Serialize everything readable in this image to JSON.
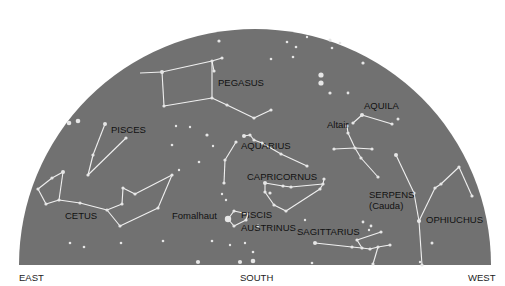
{
  "colors": {
    "sky": "#717171",
    "star": "#e6e6e6",
    "line": "#f0f0f0",
    "label": "#111111"
  },
  "dome": {
    "cx": 255,
    "baseY": 265,
    "rx": 236,
    "ry": 236,
    "left": 19,
    "right": 491
  },
  "directions": [
    {
      "label": "EAST",
      "x": 19,
      "y": 281
    },
    {
      "label": "SOUTH",
      "x": 240,
      "y": 281
    },
    {
      "label": "WEST",
      "x": 468,
      "y": 281
    }
  ],
  "constellations": [
    {
      "name": "PEGASUS",
      "x": 218,
      "y": 86,
      "stars": [
        [
          162,
          72
        ],
        [
          212,
          61
        ],
        [
          214,
          71
        ],
        [
          222,
          58
        ],
        [
          212,
          98
        ],
        [
          164,
          106
        ],
        [
          227,
          105
        ],
        [
          254,
          118
        ],
        [
          271,
          110
        ]
      ],
      "lines": [
        [
          0,
          1
        ],
        [
          1,
          4
        ],
        [
          4,
          5
        ],
        [
          5,
          0
        ],
        [
          1,
          2
        ],
        [
          1,
          3
        ],
        [
          4,
          6
        ],
        [
          6,
          7
        ],
        [
          7,
          8
        ],
        [
          0,
          -1
        ]
      ],
      "extra_lines": [
        [
          [
            162,
            72
          ],
          [
            140,
            73
          ]
        ]
      ]
    },
    {
      "name": "PISCES",
      "x": 111,
      "y": 133,
      "stars": [
        [
          105,
          124
        ],
        [
          126,
          138
        ],
        [
          93,
          155
        ],
        [
          88,
          175
        ]
      ],
      "lines": [
        [
          0,
          2
        ],
        [
          2,
          3
        ],
        [
          3,
          1
        ]
      ]
    },
    {
      "name": "CETUS",
      "x": 65,
      "y": 219,
      "stars": [
        [
          63,
          172
        ],
        [
          52,
          178
        ],
        [
          38,
          189
        ],
        [
          46,
          204
        ],
        [
          59,
          200
        ],
        [
          80,
          203
        ],
        [
          107,
          210
        ],
        [
          122,
          204
        ],
        [
          123,
          188
        ],
        [
          135,
          194
        ],
        [
          172,
          175
        ],
        [
          158,
          208
        ],
        [
          120,
          226
        ]
      ],
      "lines": [
        [
          0,
          1
        ],
        [
          1,
          2
        ],
        [
          2,
          3
        ],
        [
          3,
          4
        ],
        [
          4,
          0
        ],
        [
          4,
          5
        ],
        [
          5,
          6
        ],
        [
          6,
          7
        ],
        [
          7,
          8
        ],
        [
          8,
          9
        ],
        [
          9,
          10
        ],
        [
          10,
          11
        ],
        [
          11,
          12
        ],
        [
          12,
          6
        ]
      ]
    },
    {
      "name": "AQUARIUS",
      "x": 241,
      "y": 149,
      "stars": [
        [
          244,
          136
        ],
        [
          250,
          135
        ],
        [
          254,
          140
        ],
        [
          262,
          143
        ],
        [
          281,
          154
        ],
        [
          307,
          166
        ],
        [
          225,
          160
        ],
        [
          224,
          183
        ],
        [
          207,
          135
        ],
        [
          236,
          142
        ]
      ],
      "lines": [
        [
          0,
          1
        ],
        [
          1,
          2
        ],
        [
          2,
          3
        ],
        [
          3,
          4
        ],
        [
          4,
          5
        ],
        [
          9,
          6
        ],
        [
          6,
          7
        ]
      ]
    },
    {
      "name": "CAPRICORNUS",
      "x": 247,
      "y": 180,
      "stars": [
        [
          265,
          183
        ],
        [
          283,
          186
        ],
        [
          291,
          187
        ],
        [
          323,
          184
        ],
        [
          324,
          179
        ],
        [
          320,
          189
        ],
        [
          286,
          211
        ],
        [
          274,
          205
        ],
        [
          265,
          192
        ],
        [
          270,
          193
        ]
      ],
      "lines": [
        [
          0,
          1
        ],
        [
          1,
          2
        ],
        [
          2,
          3
        ],
        [
          3,
          4
        ],
        [
          3,
          5
        ],
        [
          5,
          6
        ],
        [
          6,
          7
        ],
        [
          7,
          8
        ],
        [
          8,
          0
        ]
      ]
    },
    {
      "name": "PISCIS\nAUSTRINUS",
      "x": 241,
      "y": 218,
      "line2_y": 231,
      "stars": [
        [
          228,
          219
        ],
        [
          234,
          211
        ],
        [
          234,
          226
        ],
        [
          246,
          220
        ],
        [
          248,
          214
        ],
        [
          258,
          226
        ]
      ],
      "lines": [
        [
          0,
          1
        ],
        [
          1,
          4
        ],
        [
          4,
          3
        ],
        [
          3,
          2
        ],
        [
          2,
          0
        ]
      ]
    },
    {
      "name": "Fomalhaut",
      "x": 172,
      "y": 219,
      "bright": [
        228,
        219
      ]
    },
    {
      "name": "SAGITTARIUS",
      "x": 297,
      "y": 235,
      "stars": [
        [
          315,
          243
        ],
        [
          352,
          247
        ],
        [
          362,
          248
        ],
        [
          370,
          249
        ],
        [
          378,
          247
        ],
        [
          390,
          245
        ],
        [
          381,
          232
        ],
        [
          357,
          240
        ],
        [
          373,
          264
        ]
      ],
      "lines": [
        [
          0,
          1
        ],
        [
          1,
          2
        ],
        [
          2,
          3
        ],
        [
          3,
          4
        ],
        [
          4,
          5
        ],
        [
          2,
          7
        ],
        [
          7,
          6
        ],
        [
          4,
          8
        ]
      ]
    },
    {
      "name": "AQUILA",
      "x": 364,
      "y": 109,
      "stars": [
        [
          362,
          115
        ],
        [
          353,
          123
        ],
        [
          347,
          126
        ],
        [
          392,
          124
        ],
        [
          348,
          133
        ],
        [
          355,
          148
        ],
        [
          334,
          149
        ],
        [
          372,
          149
        ],
        [
          361,
          158
        ],
        [
          378,
          177
        ]
      ],
      "lines": [
        [
          1,
          0
        ],
        [
          0,
          3
        ],
        [
          2,
          4
        ],
        [
          4,
          5
        ],
        [
          6,
          5
        ],
        [
          5,
          7
        ],
        [
          5,
          8
        ],
        [
          8,
          9
        ]
      ]
    },
    {
      "name": "Altair",
      "x": 327,
      "y": 128
    },
    {
      "name": "SERPENS\n(Cauda)",
      "x": 369,
      "y": 198,
      "line2_y": 209,
      "stars": [
        [
          396,
          155
        ],
        [
          414,
          193
        ],
        [
          419,
          221
        ],
        [
          422,
          265
        ]
      ],
      "lines": [
        [
          0,
          1
        ],
        [
          1,
          2
        ],
        [
          2,
          3
        ]
      ]
    },
    {
      "name": "OPHIUCHUS",
      "x": 426,
      "y": 223,
      "stars": [
        [
          419,
          221
        ],
        [
          435,
          188
        ],
        [
          441,
          184
        ],
        [
          459,
          167
        ],
        [
          472,
          196
        ]
      ],
      "lines": [
        [
          0,
          1
        ],
        [
          1,
          2
        ],
        [
          2,
          3
        ],
        [
          3,
          4
        ]
      ]
    }
  ],
  "loose_stars": [
    [
      219,
      41,
      1.6
    ],
    [
      287,
      42,
      1.3
    ],
    [
      296,
      47,
      1.3
    ],
    [
      307,
      37,
      1.2
    ],
    [
      330,
      40,
      1.6
    ],
    [
      332,
      48,
      1.3
    ],
    [
      340,
      43,
      1.3
    ],
    [
      363,
      63,
      1.6
    ],
    [
      271,
      59,
      1.3
    ],
    [
      293,
      57,
      1.3
    ],
    [
      321,
      75,
      2.6
    ],
    [
      321,
      83,
      2.6
    ],
    [
      330,
      93,
      1.6
    ],
    [
      348,
      93,
      1.4
    ],
    [
      398,
      119,
      1.5
    ],
    [
      69,
      123,
      2.3
    ],
    [
      78,
      121,
      2.3
    ],
    [
      176,
      126,
      1.2
    ],
    [
      190,
      127,
      1.2
    ],
    [
      172,
      145,
      1.3
    ],
    [
      213,
      146,
      1.2
    ],
    [
      199,
      162,
      1.3
    ],
    [
      179,
      170,
      1.2
    ],
    [
      222,
      194,
      1.2
    ],
    [
      226,
      200,
      1.2
    ],
    [
      363,
      222,
      1.4
    ],
    [
      371,
      226,
      1.4
    ],
    [
      369,
      230,
      1.2
    ],
    [
      70,
      243,
      1.3
    ],
    [
      84,
      247,
      1.3
    ],
    [
      121,
      243,
      1.3
    ],
    [
      163,
      241,
      1.3
    ],
    [
      212,
      241,
      1.3
    ],
    [
      245,
      243,
      1.2
    ],
    [
      253,
      252,
      1.3
    ],
    [
      198,
      262,
      2.1
    ],
    [
      240,
      262,
      2.1
    ],
    [
      253,
      261,
      2.3
    ],
    [
      312,
      263,
      1.3
    ],
    [
      432,
      243,
      1.5
    ],
    [
      420,
      262,
      1.2
    ],
    [
      305,
      220,
      1.2
    ],
    [
      230,
      245,
      1.2
    ]
  ]
}
